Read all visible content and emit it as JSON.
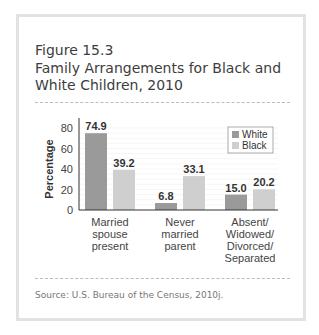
{
  "figure": {
    "label": "Figure 15.3",
    "title": "Family Arrangements for Black and White Children, 2010",
    "source": "Source: U.S. Bureau of the Census, 2010j."
  },
  "chart_data": {
    "type": "bar",
    "title": "Family Arrangements for Black and White Children, 2010",
    "xlabel": "",
    "ylabel": "Percentage",
    "ylim": [
      0,
      80
    ],
    "yticks": [
      0,
      20,
      40,
      60,
      80
    ],
    "grid": true,
    "legend_position": "top-right",
    "categories": [
      "Married spouse present",
      "Never married parent",
      "Absent/ Widowed/ Divorced/ Separated"
    ],
    "category_lines": [
      [
        "Married",
        "spouse",
        "present"
      ],
      [
        "Never",
        "married",
        "parent"
      ],
      [
        "Absent/",
        "Widowed/",
        "Divorced/",
        "Separated"
      ]
    ],
    "series": [
      {
        "name": "White",
        "color": "#9a9a9a",
        "values": [
          74.9,
          6.8,
          15.0
        ],
        "labels": [
          "74.9",
          "6.8",
          "15.0"
        ]
      },
      {
        "name": "Black",
        "color": "#cfcfcf",
        "values": [
          39.2,
          33.1,
          20.2
        ],
        "labels": [
          "39.2",
          "33.1",
          "20.2"
        ]
      }
    ]
  }
}
